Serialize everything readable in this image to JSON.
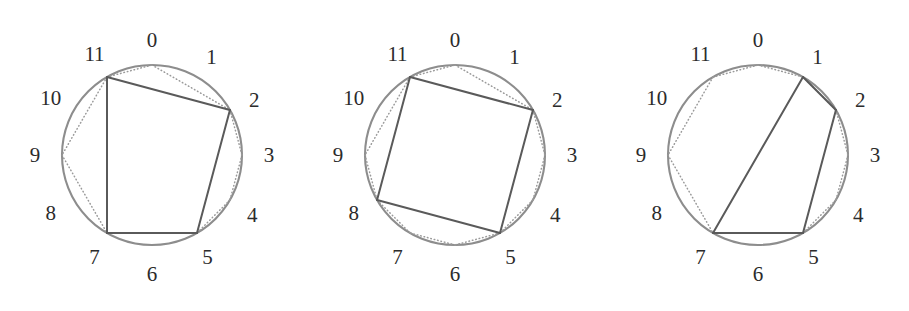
{
  "figure": {
    "type": "geometric-diagram",
    "position_labels": [
      "0",
      "1",
      "2",
      "3",
      "4",
      "5",
      "6",
      "7",
      "8",
      "9",
      "10",
      "11"
    ],
    "label_count": 12,
    "colors": {
      "circle_stroke": "#8d8d8d",
      "solid_chord": "#5a5a5a",
      "dotted_chord": "#9a9a9a",
      "label_text": "#2b2b2b",
      "background": "#ffffff"
    },
    "geometry": {
      "circle_radius": 90,
      "center_x": 152,
      "center_y": 155,
      "label_radius": 111,
      "position_angle_step_degrees": 30,
      "position_zero_angle_degrees": -90
    },
    "panels": [
      {
        "id": "panel-1",
        "index": 1,
        "solid_vertices": [
          11,
          2,
          5,
          7
        ],
        "solid_edges": [
          [
            11,
            2
          ],
          [
            2,
            5
          ],
          [
            5,
            7
          ],
          [
            7,
            11
          ]
        ],
        "dotted_edges": [
          [
            11,
            0
          ],
          [
            0,
            2
          ],
          [
            2,
            3
          ],
          [
            3,
            4
          ],
          [
            4,
            5
          ],
          [
            11,
            9
          ],
          [
            9,
            7
          ]
        ]
      },
      {
        "id": "panel-2",
        "index": 2,
        "solid_vertices": [
          11,
          2,
          5,
          8
        ],
        "solid_edges": [
          [
            11,
            2
          ],
          [
            2,
            5
          ],
          [
            5,
            8
          ],
          [
            8,
            11
          ]
        ],
        "dotted_edges": [
          [
            11,
            0
          ],
          [
            0,
            2
          ],
          [
            2,
            3
          ],
          [
            3,
            4
          ],
          [
            4,
            5
          ],
          [
            5,
            6
          ],
          [
            6,
            7
          ],
          [
            7,
            8
          ],
          [
            11,
            9
          ],
          [
            9,
            8
          ]
        ]
      },
      {
        "id": "panel-3",
        "index": 3,
        "solid_vertices": [
          1,
          2,
          5,
          7
        ],
        "solid_edges": [
          [
            1,
            2
          ],
          [
            2,
            5
          ],
          [
            5,
            7
          ],
          [
            7,
            1
          ]
        ],
        "dotted_edges": [
          [
            11,
            0
          ],
          [
            0,
            1
          ],
          [
            1,
            2
          ],
          [
            2,
            3
          ],
          [
            3,
            4
          ],
          [
            4,
            5
          ],
          [
            11,
            9
          ],
          [
            9,
            7
          ]
        ]
      }
    ]
  }
}
